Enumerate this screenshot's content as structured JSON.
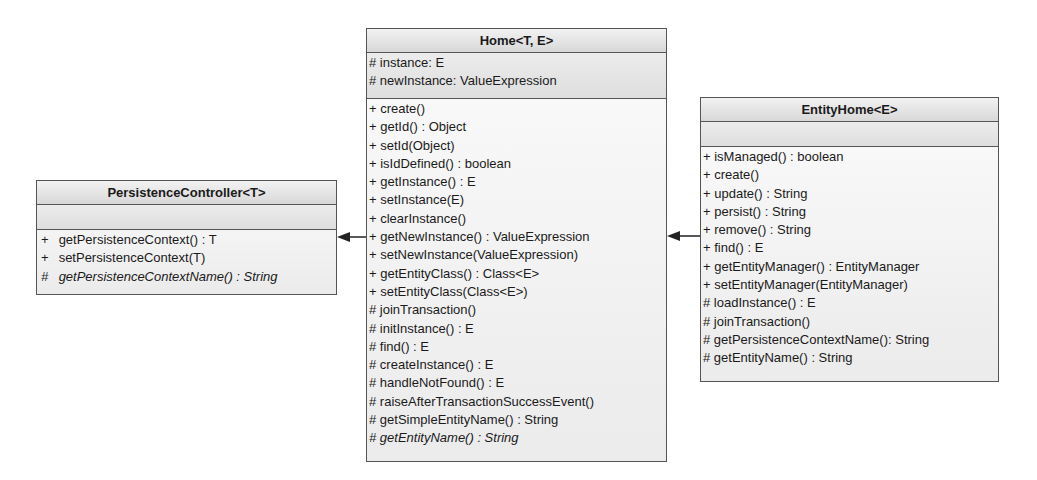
{
  "classes": {
    "persistence_controller": {
      "name": "PersistenceController<T>",
      "attributes": [],
      "methods": [
        {
          "vis": "+",
          "text": "getPersistenceContext() : T",
          "abstract": false
        },
        {
          "vis": "+",
          "text": "setPersistenceContext(T)",
          "abstract": false
        },
        {
          "vis": "#",
          "text": "getPersistenceContextName() : String",
          "abstract": true
        }
      ]
    },
    "home": {
      "name": "Home<T, E>",
      "attributes": [
        {
          "vis": "#",
          "text": "instance: E"
        },
        {
          "vis": "#",
          "text": "newInstance: ValueExpression"
        }
      ],
      "methods": [
        {
          "vis": "+",
          "text": "create()",
          "abstract": false
        },
        {
          "vis": "+",
          "text": "getId() : Object",
          "abstract": false
        },
        {
          "vis": "+",
          "text": "setId(Object)",
          "abstract": false
        },
        {
          "vis": "+",
          "text": "isIdDefined() : boolean",
          "abstract": false
        },
        {
          "vis": "+",
          "text": "getInstance() : E",
          "abstract": false
        },
        {
          "vis": "+",
          "text": "setInstance(E)",
          "abstract": false
        },
        {
          "vis": "+",
          "text": "clearInstance()",
          "abstract": false
        },
        {
          "vis": "+",
          "text": "getNewInstance() : ValueExpression",
          "abstract": false
        },
        {
          "vis": "+",
          "text": "setNewInstance(ValueExpression)",
          "abstract": false
        },
        {
          "vis": "+",
          "text": "getEntityClass() : Class<E>",
          "abstract": false
        },
        {
          "vis": "+",
          "text": "setEntityClass(Class<E>)",
          "abstract": false
        },
        {
          "vis": "#",
          "text": "joinTransaction()",
          "abstract": false
        },
        {
          "vis": "#",
          "text": "initInstance() : E",
          "abstract": false
        },
        {
          "vis": "#",
          "text": "find() : E",
          "abstract": false
        },
        {
          "vis": "#",
          "text": "createInstance() : E",
          "abstract": false
        },
        {
          "vis": "#",
          "text": "handleNotFound() : E",
          "abstract": false
        },
        {
          "vis": "#",
          "text": "raiseAfterTransactionSuccessEvent()",
          "abstract": false
        },
        {
          "vis": "#",
          "text": "getSimpleEntityName() : String",
          "abstract": false
        },
        {
          "vis": "#",
          "text": "getEntityName() : String",
          "abstract": true
        }
      ]
    },
    "entity_home": {
      "name": "EntityHome<E>",
      "attributes": [],
      "methods": [
        {
          "vis": "+",
          "text": "isManaged() : boolean",
          "abstract": false
        },
        {
          "vis": "+",
          "text": "create()",
          "abstract": false
        },
        {
          "vis": "+",
          "text": "update() : String",
          "abstract": false
        },
        {
          "vis": "+",
          "text": "persist() : String",
          "abstract": false
        },
        {
          "vis": "+",
          "text": "remove() : String",
          "abstract": false
        },
        {
          "vis": "+",
          "text": "find() : E",
          "abstract": false
        },
        {
          "vis": "+",
          "text": "getEntityManager() : EntityManager",
          "abstract": false
        },
        {
          "vis": "+",
          "text": "setEntityManager(EntityManager)",
          "abstract": false
        },
        {
          "vis": "#",
          "text": "loadInstance() : E",
          "abstract": false
        },
        {
          "vis": "#",
          "text": "joinTransaction()",
          "abstract": false
        },
        {
          "vis": "#",
          "text": "getPersistenceContextName(): String",
          "abstract": false
        },
        {
          "vis": "#",
          "text": "getEntityName() : String",
          "abstract": false
        }
      ]
    }
  },
  "relations": [
    {
      "from": "Home<T, E>",
      "to": "PersistenceController<T>",
      "type": "generalization"
    },
    {
      "from": "EntityHome<E>",
      "to": "Home<T, E>",
      "type": "generalization"
    }
  ],
  "colors": {
    "border": "#555555",
    "header": "#dcdcdc",
    "body": "#f0f0f0"
  }
}
